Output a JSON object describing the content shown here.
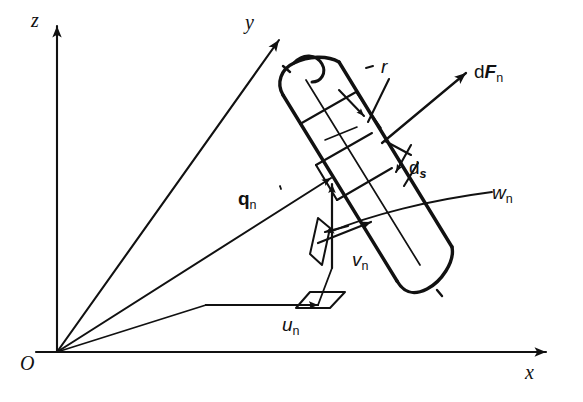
{
  "figure": {
    "background_color": "#ffffff",
    "stroke_color": "#111111",
    "width": 583,
    "height": 402
  },
  "axes": {
    "origin_label": "O",
    "items": [
      {
        "name": "z-axis",
        "label": "z",
        "direction": "up"
      },
      {
        "name": "y-axis",
        "label": "y",
        "direction": "up-right-oblique"
      },
      {
        "name": "x-axis",
        "label": "x",
        "direction": "right"
      }
    ]
  },
  "vectors": {
    "position": {
      "label": "q",
      "subscript": "n",
      "style": "bold"
    },
    "force": {
      "prefix": "d",
      "label": "F",
      "subscript": "n",
      "style": "bold-italic"
    },
    "velocity_u": {
      "label": "u",
      "subscript": "n",
      "style": "italic"
    },
    "velocity_v": {
      "label": "v",
      "subscript": "n",
      "style": "italic"
    },
    "velocity_w": {
      "label": "w",
      "subscript": "n",
      "style": "italic"
    }
  },
  "dimensions": {
    "radius": {
      "label": "r",
      "style": "italic"
    },
    "arc_length": {
      "prefix": "d",
      "label": "s",
      "subscript": "",
      "style": "bold-italic"
    }
  },
  "labels": {
    "z": "z",
    "y": "y",
    "x": "x",
    "origin": "O",
    "q_base": "q",
    "q_sub": "n",
    "dF_prefix": "d",
    "dF_base": "F",
    "dF_sub": "n",
    "u_base": "u",
    "u_sub": "n",
    "v_base": "v",
    "v_sub": "n",
    "w_base": "w",
    "w_sub": "n",
    "r": "r",
    "ds_prefix": "d",
    "ds_base": "s"
  }
}
